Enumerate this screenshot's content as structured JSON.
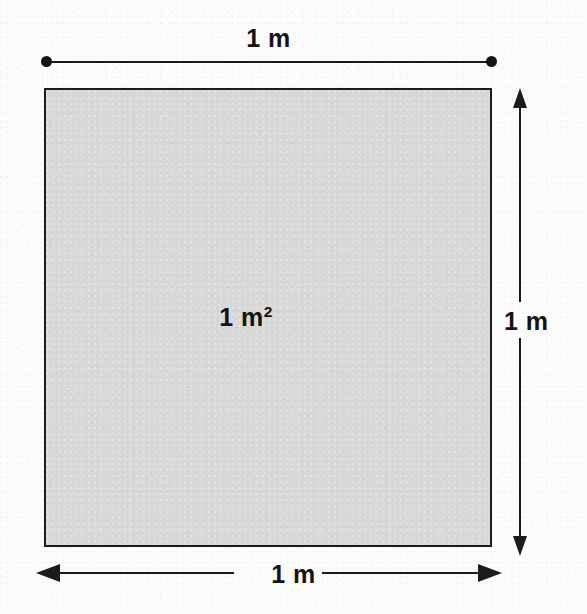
{
  "diagram": {
    "figure_type": "geometric-area-diagram",
    "shape": "square",
    "colors": {
      "page_background": "#fcfcfc",
      "shape_fill": "#d9d9d9",
      "stroke": "#1c1c1c",
      "text": "#141414"
    },
    "top_dimension": {
      "label": "1 m",
      "endpoint_style": "dot",
      "orientation": "horizontal"
    },
    "right_dimension": {
      "label": "1 m",
      "endpoint_style": "arrow",
      "orientation": "vertical"
    },
    "bottom_dimension": {
      "label": "1 m",
      "endpoint_style": "arrow",
      "orientation": "horizontal"
    },
    "area_label": {
      "value": "1 m",
      "exponent": "2"
    }
  }
}
